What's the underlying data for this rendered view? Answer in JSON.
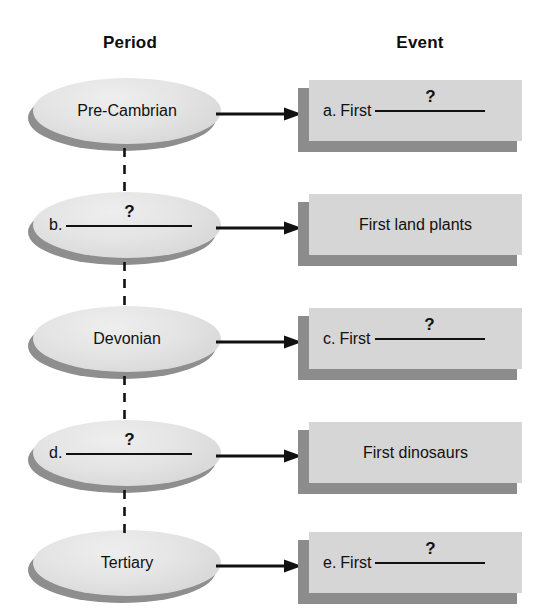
{
  "headers": {
    "left": "Period",
    "right": "Event"
  },
  "question_mark": "?",
  "colors": {
    "node_fill": "#e2e2e2",
    "node_shadow": "#8e8e8e",
    "box_fill": "#d6d6d6",
    "box_shadow": "#8c8c8c",
    "ink": "#111111",
    "page": "#ffffff"
  },
  "rows": [
    {
      "period": {
        "kind": "label",
        "text": "Pre-Cambrian",
        "letter": "",
        "blank": ""
      },
      "event": {
        "kind": "blank",
        "letter": "a.",
        "prefix": "First",
        "text": ""
      },
      "connector_below": true
    },
    {
      "period": {
        "kind": "blank",
        "letter": "b.",
        "text": ""
      },
      "event": {
        "kind": "label",
        "letter": "",
        "prefix": "",
        "text": "First land plants"
      },
      "connector_below": true
    },
    {
      "period": {
        "kind": "label",
        "text": "Devonian",
        "letter": "",
        "blank": ""
      },
      "event": {
        "kind": "blank",
        "letter": "c.",
        "prefix": "First",
        "text": ""
      },
      "connector_below": true
    },
    {
      "period": {
        "kind": "blank",
        "letter": "d.",
        "text": ""
      },
      "event": {
        "kind": "label",
        "letter": "",
        "prefix": "",
        "text": "First dinosaurs"
      },
      "connector_below": true
    },
    {
      "period": {
        "kind": "label",
        "text": "Tertiary",
        "letter": "",
        "blank": ""
      },
      "event": {
        "kind": "blank",
        "letter": "e.",
        "prefix": "First",
        "text": ""
      },
      "connector_below": false
    }
  ]
}
